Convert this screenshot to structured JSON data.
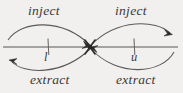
{
  "figure": {
    "background_color": "#f1f0ee",
    "stroke_color": "#4a4a4a",
    "axis": {
      "name": "number-line",
      "y": 47,
      "x_start": 3,
      "x_end": 178,
      "ticks": [
        {
          "label": "l",
          "x": 48
        },
        {
          "label": "u",
          "x": 134
        }
      ],
      "center_node_x": 90
    },
    "labels": {
      "inject_left": "inject",
      "inject_right": "inject",
      "extract_left": "extract",
      "extract_right": "extract",
      "lower_bound": "l",
      "upper_bound": "u"
    },
    "arcs": [
      {
        "name": "inject-left-arc",
        "label": "inject",
        "side": "upper-left",
        "direction": "rightward-to-center",
        "arrowhead": "center"
      },
      {
        "name": "inject-right-arc",
        "label": "inject",
        "side": "upper-right",
        "direction": "rightward-away-from-center",
        "arrowhead": "right-end"
      },
      {
        "name": "extract-left-arc",
        "label": "extract",
        "side": "lower-left",
        "direction": "leftward-away-from-center",
        "arrowhead": "left-end"
      },
      {
        "name": "extract-right-arc",
        "label": "extract",
        "side": "lower-right",
        "direction": "leftward-to-center",
        "arrowhead": "center"
      }
    ]
  }
}
